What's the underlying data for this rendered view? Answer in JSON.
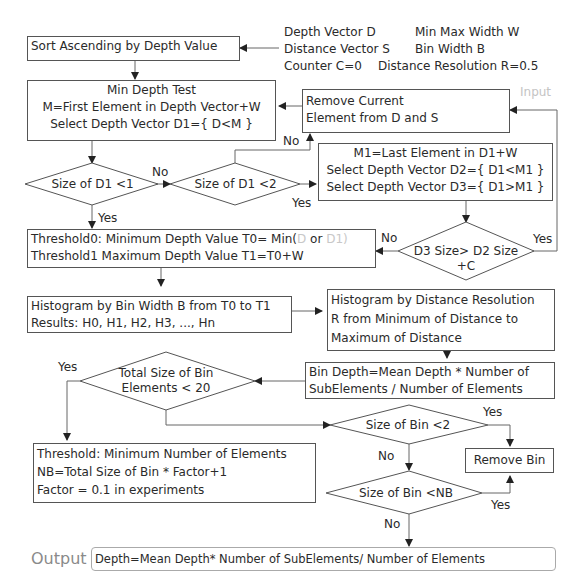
{
  "input": {
    "label": "Input",
    "lines": [
      {
        "left": "Depth Vector D",
        "right": "Min Max Width W"
      },
      {
        "left": "Distance Vector S",
        "right": "Bin Width B"
      },
      {
        "left": "Counter C=0",
        "right": "Distance Resolution R=0.5"
      }
    ]
  },
  "nodes": {
    "sort": {
      "text": "Sort Ascending by Depth Value"
    },
    "min_depth_test": {
      "lines": [
        "Min Depth Test",
        "M=First Element in Depth Vector+W",
        "Select Depth Vector D1={ D<M }"
      ]
    },
    "remove_current": {
      "lines": [
        "Remove Current",
        "Element from D and S"
      ]
    },
    "size_d1_lt1": {
      "text": "Size of D1  <1"
    },
    "size_d1_lt2": {
      "text": "Size of D1  <2"
    },
    "m1_select": {
      "lines": [
        "M1=Last Element in D1+W",
        "Select Depth Vector D2={ D1<M1 }",
        "Select Depth Vector D3={ D1>M1 }"
      ]
    },
    "d3_vs_d2": {
      "lines": [
        "D3 Size> D2 Size",
        "+C"
      ]
    },
    "threshold": {
      "line1_prefix": "Threshold0: Minimum Depth Value T0= Min(",
      "line1_faded1": "D",
      "line1_mid": " or ",
      "line1_faded2": "D1",
      "line1_suffix": ")",
      "line2": "Threshold1 Maximum Depth Value T1=T0+W"
    },
    "histogram_bin": {
      "lines": [
        "Histogram by Bin Width B from T0 to T1",
        "Results: H0, H1, H2, H3, ..., Hn"
      ]
    },
    "histogram_distance": {
      "lines": [
        "Histogram by Distance Resolution",
        "R from Minimum of Distance to",
        "Maximum of Distance"
      ]
    },
    "bin_depth": {
      "lines": [
        "Bin Depth=Mean Depth * Number of",
        "SubElements / Number of Elements"
      ]
    },
    "total_size": {
      "lines": [
        "Total Size of Bin",
        "Elements < 20"
      ]
    },
    "threshold_min": {
      "lines": [
        "Threshold: Minimum Number of Elements",
        "NB=Total Size of Bin * Factor+1",
        "Factor = 0.1 in experiments"
      ]
    },
    "size_bin_lt2": {
      "text": "Size of Bin <2"
    },
    "remove_bin": {
      "text": "Remove Bin"
    },
    "size_bin_ltnb": {
      "text": "Size of Bin <NB"
    }
  },
  "edge_labels": {
    "no_d1_lt1": "No",
    "yes_d1_lt1": "Yes",
    "no_d1_lt2": "No",
    "yes_d1_lt2": "Yes",
    "no_d3": "No",
    "yes_d3": "Yes",
    "yes_total": "Yes",
    "yes_bin_lt2": "Yes",
    "no_bin_lt2": "No",
    "yes_bin_ltnb": "Yes",
    "no_bin_ltnb": "No"
  },
  "output": {
    "label": "Output",
    "text": "Depth=Mean Depth* Number of SubElements/ Number of Elements"
  }
}
